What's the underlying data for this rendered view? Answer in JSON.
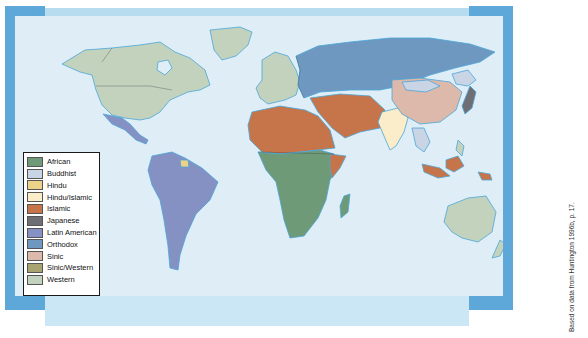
{
  "map": {
    "title_visible": false,
    "legend": {
      "items": [
        {
          "label": "African",
          "color": "#6e9a78"
        },
        {
          "label": "Buddhist",
          "color": "#c9d4e4"
        },
        {
          "label": "Hindu",
          "color": "#edd28a"
        },
        {
          "label": "Hindu/Islamic",
          "color": "#fbedc9"
        },
        {
          "label": "Islamic",
          "color": "#c6744a"
        },
        {
          "label": "Japanese",
          "color": "#6f6e74"
        },
        {
          "label": "Latin American",
          "color": "#8591c2"
        },
        {
          "label": "Orthodox",
          "color": "#6e98bf"
        },
        {
          "label": "Sinic",
          "color": "#dcb9ab"
        },
        {
          "label": "Sinic/Western",
          "color": "#a8a471"
        },
        {
          "label": "Western",
          "color": "#c3d2bd"
        }
      ]
    },
    "credit": "Based on data from Huntington 1996b, p. 17.",
    "colors": {
      "ocean": "#dfeef6",
      "frame": "#5ea7d9",
      "coast": "#4aa6da",
      "border": "#3a3a3a"
    }
  }
}
